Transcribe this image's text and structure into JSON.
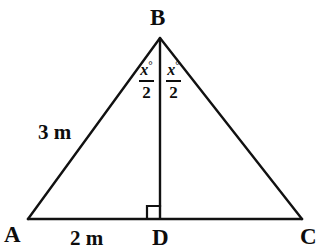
{
  "figure": {
    "type": "geometry-diagram",
    "background_color": "#ffffff",
    "stroke_color": "#111111",
    "text_color": "#0d0d0d",
    "stroke_width": 2,
    "canvas": {
      "width": 327,
      "height": 249
    },
    "points": {
      "A": {
        "x": 28,
        "y": 219
      },
      "B": {
        "x": 160,
        "y": 38
      },
      "C": {
        "x": 302,
        "y": 219
      },
      "D": {
        "x": 160,
        "y": 219
      }
    },
    "segments": [
      {
        "name": "AB",
        "from": "A",
        "to": "B"
      },
      {
        "name": "BC",
        "from": "B",
        "to": "C"
      },
      {
        "name": "AC",
        "from": "A",
        "to": "C"
      },
      {
        "name": "BD",
        "from": "B",
        "to": "D"
      }
    ],
    "right_angle": {
      "at": "D",
      "size": 13,
      "side": "left"
    }
  },
  "vertex_labels": {
    "B": "B",
    "A": "A",
    "D": "D",
    "C": "C"
  },
  "measure_labels": {
    "side_ab": "3 m",
    "segment_ad": "2 m"
  },
  "angle_labels": {
    "left": {
      "numerator": "x",
      "degree": "°",
      "denominator": "2",
      "text": "x°/2"
    },
    "right": {
      "numerator": "x",
      "degree": "°",
      "denominator": "2",
      "text": "x°/2"
    }
  }
}
